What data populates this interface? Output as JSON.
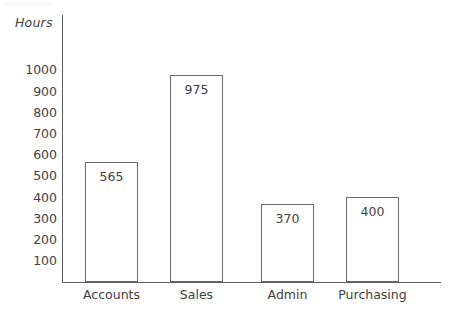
{
  "chart_data": {
    "type": "bar",
    "title": "",
    "xlabel": "",
    "ylabel": "Hours",
    "categories": [
      "Accounts",
      "Sales",
      "Admin",
      "Purchasing"
    ],
    "values": [
      565,
      975,
      370,
      400
    ],
    "value_labels": [
      "565",
      "975",
      "370",
      "400"
    ],
    "ylim": [
      0,
      1050
    ],
    "ytick_values": [
      1000,
      900,
      800,
      700,
      600,
      500,
      400,
      300,
      200,
      100
    ],
    "yticks": [
      "1000",
      "900",
      "800",
      "700",
      "600",
      "500",
      "400",
      "300",
      "200",
      "100"
    ],
    "grid": false,
    "legend": false,
    "legend_position": "none",
    "bar_fill": "#ffffff",
    "bar_stroke": "#6b6b6b",
    "axis_color": "#5e5e5e",
    "text_color": "#3f3f3f"
  }
}
